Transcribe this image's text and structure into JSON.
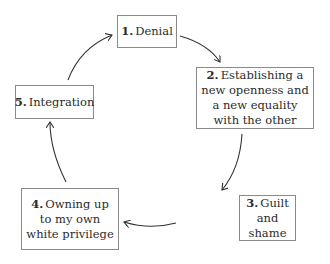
{
  "diagram": {
    "type": "cycle",
    "nodes": [
      {
        "id": 1,
        "number": "1.",
        "label": "Denial"
      },
      {
        "id": 2,
        "number": "2.",
        "label": "Establishing a new openness and a new equality with the other"
      },
      {
        "id": 3,
        "number": "3.",
        "label": "Guilt and shame"
      },
      {
        "id": 4,
        "number": "4.",
        "label": "Owning up to my own white privilege"
      },
      {
        "id": 5,
        "number": "5.",
        "label": "Integration"
      }
    ],
    "edges": [
      {
        "from": 1,
        "to": 2
      },
      {
        "from": 2,
        "to": 3
      },
      {
        "from": 3,
        "to": 4
      },
      {
        "from": 4,
        "to": 5
      },
      {
        "from": 5,
        "to": 1
      }
    ],
    "colors": {
      "border": "#8a8a8a",
      "arrow": "#333333",
      "text": "#2b2b2b"
    }
  }
}
